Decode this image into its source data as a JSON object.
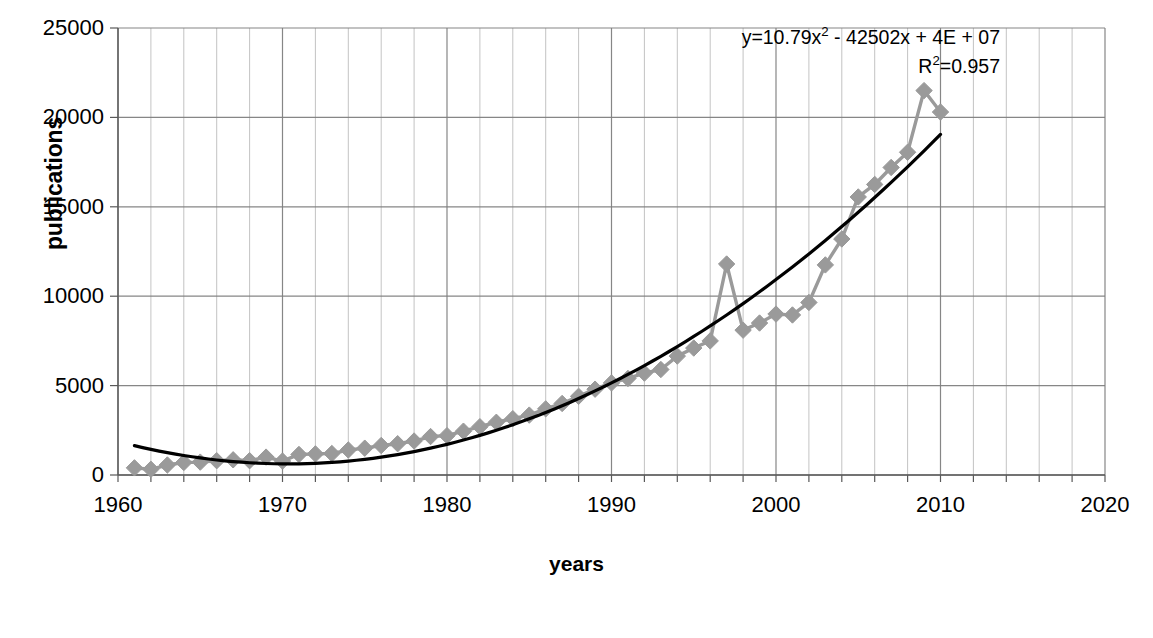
{
  "chart_data": {
    "type": "line",
    "title": "",
    "xlabel": "years",
    "ylabel": "publications",
    "xlim": [
      1960,
      2020
    ],
    "ylim": [
      0,
      25000
    ],
    "grid": true,
    "legend": false,
    "x_ticks": [
      "1960",
      "1970",
      "1980",
      "1990",
      "2000",
      "2010",
      "2020"
    ],
    "x_tick_values": [
      1960,
      1970,
      1980,
      1990,
      2000,
      2010,
      2020
    ],
    "y_ticks": [
      "0",
      "5000",
      "10000",
      "15000",
      "20000",
      "25000"
    ],
    "y_tick_values": [
      0,
      5000,
      10000,
      15000,
      20000,
      25000
    ],
    "x_minor_step": 2,
    "marker": "diamond",
    "series": [
      {
        "name": "publications",
        "color": "#9a9a9a",
        "x": [
          1961,
          1962,
          1963,
          1964,
          1965,
          1966,
          1967,
          1968,
          1969,
          1970,
          1971,
          1972,
          1973,
          1974,
          1975,
          1976,
          1977,
          1978,
          1979,
          1980,
          1981,
          1982,
          1983,
          1984,
          1985,
          1986,
          1987,
          1988,
          1989,
          1990,
          1991,
          1992,
          1993,
          1994,
          1995,
          1996,
          1997,
          1998,
          1999,
          2000,
          2001,
          2002,
          2003,
          2004,
          2005,
          2006,
          2007,
          2008,
          2009,
          2010
        ],
        "values": [
          400,
          320,
          560,
          700,
          720,
          800,
          850,
          800,
          1000,
          780,
          1150,
          1180,
          1200,
          1400,
          1500,
          1650,
          1750,
          1900,
          2150,
          2200,
          2450,
          2700,
          2950,
          3150,
          3350,
          3700,
          4000,
          4400,
          4800,
          5150,
          5400,
          5700,
          5900,
          6650,
          7100,
          7500,
          11800,
          8100,
          8500,
          9000,
          8950,
          9650,
          11750,
          13200,
          15550,
          16250,
          17200,
          18050,
          21500,
          20300
        ]
      }
    ],
    "trendline": {
      "name": "polynomial-trendline",
      "color": "#000000",
      "order": 2,
      "equation": "y=10.79x² - 42502x + 4E + 07",
      "equation_prefix": "y=10.79x",
      "equation_superscript": "2",
      "equation_suffix": " - 42502x + 4E + 07",
      "r2_label": "R",
      "r2_superscript": "2",
      "r2_value": "=0.957",
      "r2_text": "R²=0.957",
      "x_start": 1961,
      "x_end": 2010,
      "coefficients": {
        "a": 10.79,
        "b": -42502,
        "c": 40000000
      }
    }
  },
  "colors": {
    "series": "#9a9a9a",
    "trendline": "#000000",
    "grid": "#808080",
    "axis": "#595959",
    "text": "#000000",
    "background": "#ffffff"
  },
  "annotations": {
    "equation_line1": "y=10.79x² - 42502x + 4E + 07",
    "equation_line2": "R²=0.957"
  }
}
